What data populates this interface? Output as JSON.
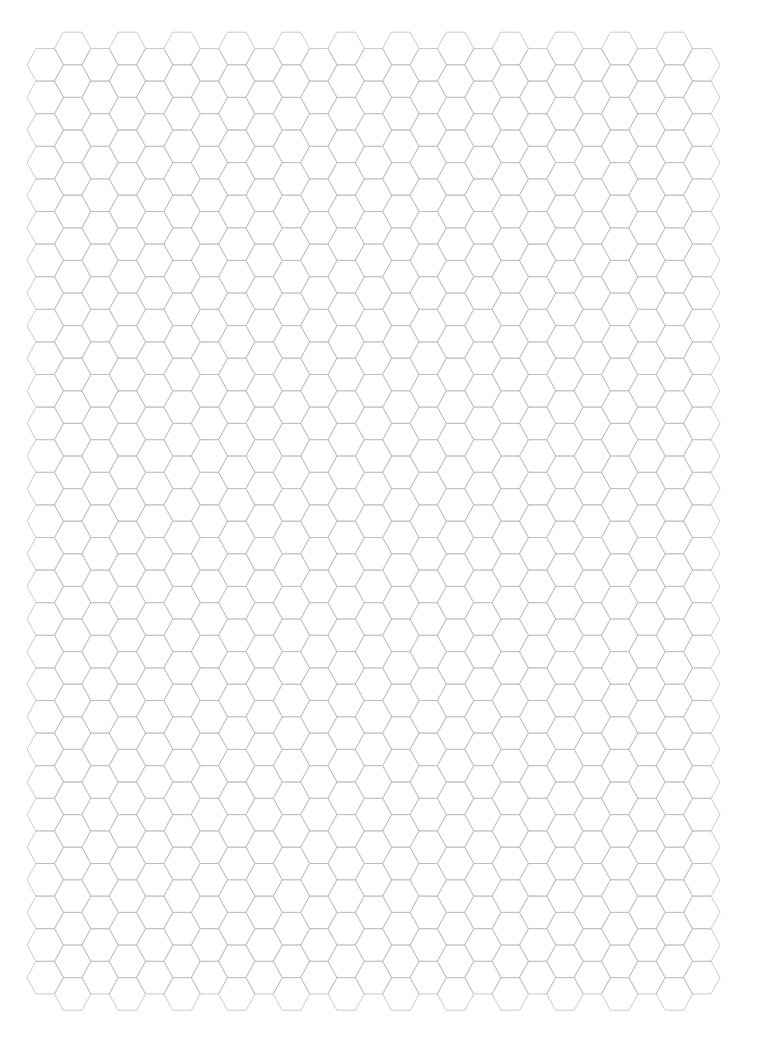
{
  "page": {
    "type": "hexagonal graph paper",
    "width": 765,
    "height": 1049,
    "background": "#ffffff"
  },
  "grid": {
    "orientation": "flat-top",
    "columns": 25,
    "origin_x": 27,
    "column_spacing": 27.35,
    "hex_width": 36.6,
    "hex_overhang": 9.0,
    "hex_height": 32.6,
    "low_columns": {
      "parity": "even",
      "top_y": 48.5,
      "rows": 29
    },
    "high_columns": {
      "parity": "odd",
      "top_y": 32.2,
      "rows": 30
    },
    "stroke_color": "#bdbdbd",
    "stroke_width": 0.8
  }
}
